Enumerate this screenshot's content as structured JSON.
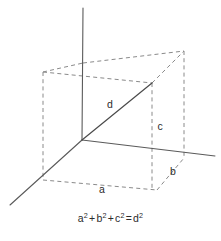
{
  "figure": {
    "background_color": "#ffffff",
    "width": 221,
    "height": 241
  },
  "colors": {
    "axis": "#5a5a5a",
    "diagonal": "#4a4a4a",
    "hidden_edge": "#8a8a8a",
    "text": "#2b2b2b"
  },
  "labels": {
    "a": "a",
    "b": "b",
    "c": "c",
    "d": "d"
  },
  "label_positions": {
    "a": {
      "x": 102,
      "y": 190
    },
    "b": {
      "x": 173,
      "y": 172
    },
    "c": {
      "x": 160,
      "y": 127
    },
    "d": {
      "x": 110,
      "y": 105
    }
  },
  "caption": {
    "terms": [
      "a",
      "b",
      "c"
    ],
    "exponent": "2",
    "plus": "+",
    "equals": "=",
    "result": "d",
    "full_text": "a² + b² + c² = d²"
  },
  "geometry": {
    "origin": {
      "x": 82,
      "y": 140
    },
    "axes": [
      {
        "name": "z-axis",
        "x1": 83,
        "y1": 8,
        "x2": 82,
        "y2": 140,
        "style": "solid"
      },
      {
        "name": "x-axis",
        "x1": 82,
        "y1": 140,
        "x2": 10,
        "y2": 205,
        "style": "solid"
      },
      {
        "name": "y-axis",
        "x1": 82,
        "y1": 140,
        "x2": 215,
        "y2": 156,
        "style": "solid"
      }
    ],
    "diagonal": {
      "name": "space-diagonal-d",
      "x1": 82,
      "y1": 140,
      "x2": 152,
      "y2": 83
    },
    "box_vertices": {
      "origin": {
        "x": 82,
        "y": 140
      },
      "top_back_left": {
        "x": 43,
        "y": 72
      },
      "top_back_right": {
        "x": 184,
        "y": 51
      },
      "top_front_mid": {
        "x": 152,
        "y": 83
      },
      "top_above_origin": {
        "x": 83,
        "y": 63
      },
      "bottom_front_left": {
        "x": 43,
        "y": 180
      },
      "bottom_front_right": {
        "x": 157,
        "y": 190
      },
      "bottom_right_on_axis": {
        "x": 183,
        "y": 158
      },
      "mid_right_on_axis": {
        "x": 152,
        "y": 155
      }
    }
  }
}
